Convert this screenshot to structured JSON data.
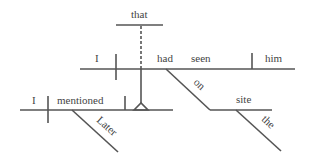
{
  "diagram": {
    "type": "Reed-Kellogg sentence diagram",
    "sentence_words": [
      "Later",
      "I",
      "mentioned",
      "that",
      "I",
      "had",
      "seen",
      "him",
      "on",
      "site",
      "the"
    ],
    "clauses": {
      "main": {
        "subject": "I",
        "verb": "mentioned",
        "modifier": "Later"
      },
      "noun_clause": {
        "connector": "that",
        "subject": "I",
        "verb_auxiliary": "had",
        "verb": "seen",
        "object": "him",
        "preposition": "on",
        "prep_object": "site",
        "article": "the"
      }
    },
    "colors": {
      "line": "#555555",
      "text": "#444444",
      "background": "#ffffff"
    }
  }
}
